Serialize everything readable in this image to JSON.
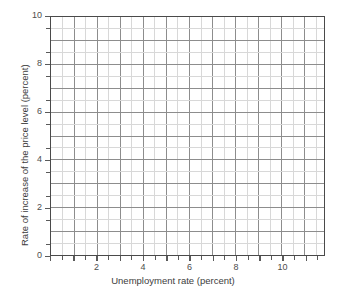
{
  "chart_data": {
    "type": "scatter",
    "title": "",
    "subtitle": "",
    "xlabel": "Unemployment rate (percent)",
    "ylabel": "Rate of increase of the price level (percent)",
    "xlim": [
      0,
      11.83
    ],
    "ylim": [
      0,
      10
    ],
    "x_major_ticks": [
      2,
      4,
      6,
      8,
      10
    ],
    "x_tick_labels": [
      "2",
      "4",
      "6",
      "8",
      "10"
    ],
    "y_major_ticks": [
      0,
      2,
      4,
      6,
      8,
      10
    ],
    "y_tick_labels": [
      "0",
      "2",
      "4",
      "6",
      "8",
      "10"
    ],
    "x_minor_step": 0.5,
    "y_minor_step": 0.5,
    "grid": true,
    "grid_major_color": "#8c8c8c",
    "grid_minor_color": "#d8d8d8",
    "frame_color": "#4a4a4a",
    "background": "#ffffff",
    "legend": null,
    "legend_position": "none",
    "series": [],
    "values": [],
    "categories": [],
    "annotations": [],
    "note": "Empty plotting grid: no data points, lines, or curves are drawn."
  },
  "axes": {
    "x": {
      "title": "Unemployment rate (percent)",
      "ticks": [
        {
          "value": 2,
          "label": "2"
        },
        {
          "value": 4,
          "label": "4"
        },
        {
          "value": 6,
          "label": "6"
        },
        {
          "value": 8,
          "label": "8"
        },
        {
          "value": 10,
          "label": "10"
        }
      ]
    },
    "y": {
      "title": "Rate of increase of the price level (percent)",
      "ticks": [
        {
          "value": 10,
          "label": "10"
        },
        {
          "value": 8,
          "label": "8"
        },
        {
          "value": 6,
          "label": "6"
        },
        {
          "value": 4,
          "label": "4"
        },
        {
          "value": 2,
          "label": "2"
        },
        {
          "value": 0,
          "label": "0"
        }
      ]
    }
  }
}
